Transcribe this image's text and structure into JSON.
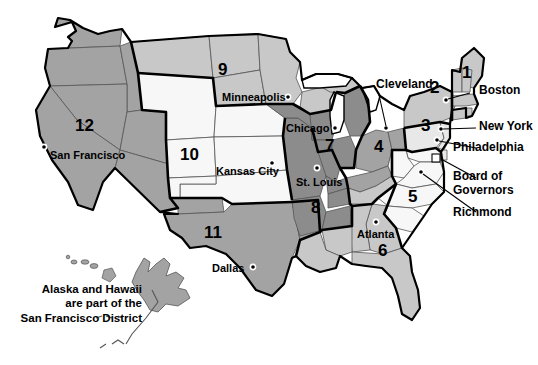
{
  "map": {
    "title": "Federal Reserve Districts Map",
    "colors": {
      "dark_gray": "#8c8c8c",
      "mid_gray": "#a3a3a3",
      "light_gray": "#c8c8c8",
      "pale_gray": "#e8e8e8",
      "white": "#f7f7f7",
      "outline": "#000000",
      "state_line": "#555555",
      "text": "#000000",
      "background": "#ffffff"
    },
    "districts": [
      {
        "number": "1",
        "bank_city": "Boston",
        "shade": "light_gray",
        "label_x": 466,
        "label_y": 73
      },
      {
        "number": "2",
        "bank_city": "New York",
        "shade": "light_gray",
        "label_x": 434,
        "label_y": 85
      },
      {
        "number": "3",
        "bank_city": "Philadelphia",
        "shade": "pale_gray",
        "label_x": 425,
        "label_y": 122
      },
      {
        "number": "4",
        "bank_city": "Cleveland",
        "shade": "mid_gray",
        "label_x": 379,
        "label_y": 143
      },
      {
        "number": "5",
        "bank_city": "Richmond",
        "shade": "white",
        "label_x": 412,
        "label_y": 192
      },
      {
        "number": "6",
        "bank_city": "Atlanta",
        "shade": "light_gray",
        "label_x": 382,
        "label_y": 246
      },
      {
        "number": "7",
        "bank_city": "Chicago",
        "shade": "dark_gray",
        "label_x": 329,
        "label_y": 141
      },
      {
        "number": "8",
        "bank_city": "St. Louis",
        "shade": "dark_gray",
        "label_x": 315,
        "label_y": 203
      },
      {
        "number": "9",
        "bank_city": "Minneapolis",
        "shade": "light_gray",
        "label_x": 222,
        "label_y": 66
      },
      {
        "number": "10",
        "bank_city": "Kansas City",
        "shade": "white",
        "label_x": 187,
        "label_y": 150
      },
      {
        "number": "11",
        "bank_city": "Dallas",
        "shade": "mid_gray",
        "label_x": 210,
        "label_y": 228
      },
      {
        "number": "12",
        "bank_city": "San Francisco",
        "shade": "mid_gray",
        "label_x": 81,
        "label_y": 122
      }
    ],
    "city_labels": [
      {
        "name": "Minneapolis",
        "x": 222,
        "y": 89,
        "align": "left",
        "dot_x": 288,
        "dot_y": 97
      },
      {
        "name": "Chicago",
        "x": 286,
        "y": 122,
        "align": "left",
        "dot_x": 335,
        "dot_y": 128
      },
      {
        "name": "San Francisco",
        "x": 50,
        "y": 149,
        "align": "left",
        "dot_x": 44,
        "dot_y": 147
      },
      {
        "name": "Kansas City",
        "x": 216,
        "y": 167,
        "align": "left",
        "dot_x": 272,
        "dot_y": 163
      },
      {
        "name": "St. Louis",
        "x": 299,
        "y": 178,
        "align": "left",
        "dot_x": 317,
        "dot_y": 168
      },
      {
        "name": "Atlanta",
        "x": 360,
        "y": 231,
        "align": "left",
        "dot_x": 376,
        "dot_y": 222
      },
      {
        "name": "Dallas",
        "x": 214,
        "y": 265,
        "align": "left",
        "dot_x": 253,
        "dot_y": 267
      }
    ],
    "callouts": [
      {
        "name": "Cleveland",
        "x": 379,
        "y": 82,
        "leader": "M 379,95 L 386,128"
      },
      {
        "name": "Boston",
        "x": 472,
        "y": 87,
        "leader": "M 470,93 L 446,100"
      },
      {
        "name": "New York",
        "x": 478,
        "y": 123,
        "leader": "M 476,128 L 441,129"
      },
      {
        "name": "Philadelphia",
        "x": 478,
        "y": 144,
        "leader": "M 476,149 L 437,140"
      },
      {
        "name": "Board of",
        "x": 478,
        "y": 173,
        "leader": "M 476,180 L 436,171"
      },
      {
        "name": "Governors",
        "x": 478,
        "y": 187,
        "leader": ""
      },
      {
        "name": "Richmond",
        "x": 478,
        "y": 211,
        "leader": "M 476,215 L 440,200"
      }
    ],
    "note": {
      "line1": "Alaska and Hawaii",
      "line2": "are part of the",
      "line3": "San Francisco District",
      "x": 18,
      "y": 283
    }
  }
}
